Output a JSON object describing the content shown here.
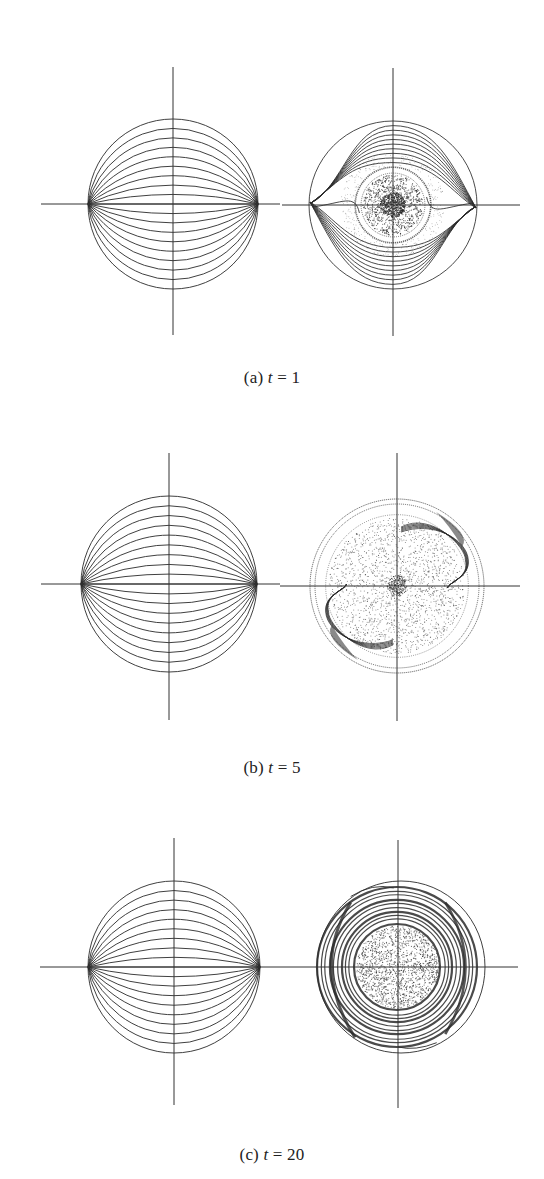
{
  "figure": {
    "stroke_color": "#2a2a2a",
    "axis_color": "#333333",
    "panels": [
      {
        "id": "a",
        "caption": {
          "label": "(a)",
          "var": "t",
          "eq": "=",
          "value": "1",
          "top": 368
        },
        "left": {
          "cx": 173,
          "cy": 204,
          "r": 85,
          "vaxis": [
            67,
            335
          ],
          "haxis": [
            41,
            280
          ]
        },
        "right": {
          "cx": 393,
          "cy": 205,
          "r": 84,
          "vaxis": [
            68,
            336
          ],
          "haxis": [
            282,
            520
          ],
          "state": "vortex-core"
        }
      },
      {
        "id": "b",
        "caption": {
          "label": "(b)",
          "var": "t",
          "eq": "=",
          "value": "5",
          "top": 758
        },
        "left": {
          "cx": 169,
          "cy": 584,
          "r": 88,
          "vaxis": [
            453,
            720
          ],
          "haxis": [
            41,
            280
          ]
        },
        "right": {
          "cx": 397,
          "cy": 586,
          "r": 87,
          "vaxis": [
            453,
            721
          ],
          "haxis": [
            280,
            520
          ],
          "state": "mixed-diffuse"
        }
      },
      {
        "id": "c",
        "caption": {
          "label": "(c)",
          "var": "t",
          "eq": "=",
          "value": "20",
          "top": 1145
        },
        "left": {
          "cx": 174,
          "cy": 967,
          "r": 86,
          "vaxis": [
            838,
            1105
          ],
          "haxis": [
            40,
            280
          ]
        },
        "right": {
          "cx": 398,
          "cy": 967,
          "r": 86,
          "vaxis": [
            840,
            1108
          ],
          "haxis": [
            280,
            518
          ],
          "state": "concentric-rings"
        }
      }
    ],
    "initial_curves_count": 19
  }
}
